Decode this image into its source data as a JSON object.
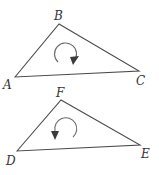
{
  "diagram": {
    "triangles": [
      {
        "id": "ABC",
        "vertices": {
          "A": {
            "label": "A",
            "x": 15,
            "y": 77
          },
          "B": {
            "label": "B",
            "x": 59,
            "y": 24
          },
          "C": {
            "label": "C",
            "x": 139,
            "y": 71
          }
        },
        "orientation": "clockwise",
        "arrow_icon": "clockwise-arrow-icon"
      },
      {
        "id": "DEF",
        "vertices": {
          "D": {
            "label": "D",
            "x": 17,
            "y": 151
          },
          "E": {
            "label": "E",
            "x": 140,
            "y": 145
          },
          "F": {
            "label": "F",
            "x": 61,
            "y": 100
          }
        },
        "orientation": "counterclockwise",
        "arrow_icon": "counterclockwise-arrow-icon"
      }
    ],
    "colors": {
      "stroke": "#4a4a4a",
      "label": "#333333",
      "background": "#ffffff"
    }
  }
}
